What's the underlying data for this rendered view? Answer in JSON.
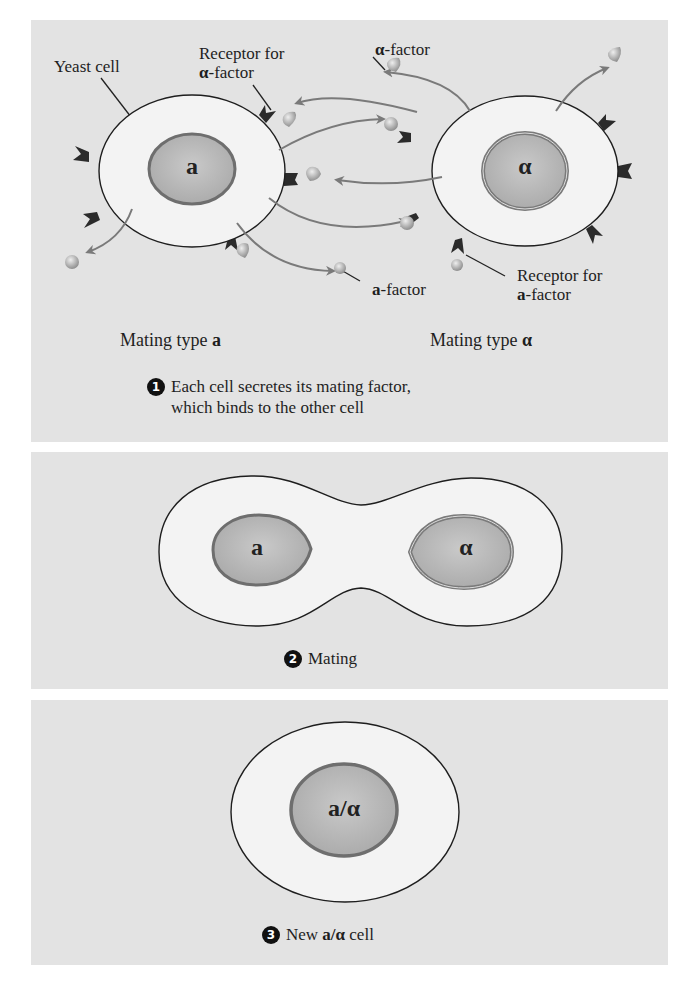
{
  "figure": {
    "panel1": {
      "labels": {
        "yeast_cell": "Yeast cell",
        "receptor_alpha_line1": "Receptor for",
        "receptor_alpha_line2_sym": "α",
        "receptor_alpha_line2_rest": "-factor",
        "alpha_factor_sym": "α",
        "alpha_factor_rest": "-factor",
        "a_factor_sym": "a",
        "a_factor_rest": "-factor",
        "receptor_a_line1": "Receptor for",
        "receptor_a_line2_sym": "a",
        "receptor_a_line2_rest": "-factor"
      },
      "cell_left_nucleus": "a",
      "cell_right_nucleus": "α",
      "mating_type_a_text": "Mating type ",
      "mating_type_a_sym": "a",
      "mating_type_alpha_text": "Mating type ",
      "mating_type_alpha_sym": "α",
      "step_number": "1",
      "step_line1": "Each cell secretes its mating factor,",
      "step_line2": "which binds to the other cell"
    },
    "panel2": {
      "nucleus_left": "a",
      "nucleus_right": "α",
      "step_number": "2",
      "step_text": "Mating"
    },
    "panel3": {
      "nucleus": "a/α",
      "step_number": "3",
      "step_text_pre": "New ",
      "step_text_sym": "a/α",
      "step_text_post": " cell"
    }
  },
  "colors": {
    "panel_bg": "#e3e3e3",
    "cell_fill": "#f3f3f3",
    "nucleus_fill": "#b8b8b8",
    "nucleus_ring": "#6e6e6e",
    "receptor": "#2b2b2b",
    "arrow": "#7a7a7a",
    "factor": "#a8a8a8"
  }
}
